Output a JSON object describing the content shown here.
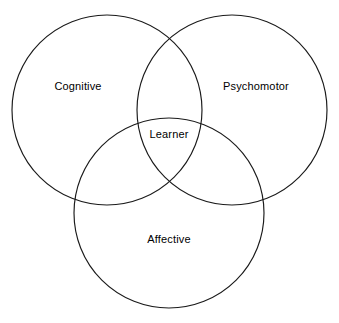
{
  "diagram": {
    "type": "venn-3-set",
    "title": "",
    "background_color": "#ffffff",
    "stroke_color": "#1a1a1a",
    "text_color": "#000000",
    "sets": [
      {
        "id": "cognitive",
        "label": "Cognitive",
        "position": "top-left",
        "cx": 107,
        "cy": 110,
        "r": 95,
        "label_x": 78,
        "label_y": 87
      },
      {
        "id": "psychomotor",
        "label": "Psychomotor",
        "position": "top-right",
        "cx": 232,
        "cy": 110,
        "r": 95,
        "label_x": 256,
        "label_y": 87
      },
      {
        "id": "affective",
        "label": "Affective",
        "position": "bottom-center",
        "cx": 169,
        "cy": 213,
        "r": 95,
        "label_x": 169,
        "label_y": 240
      }
    ],
    "intersection": {
      "id": "learner",
      "label": "Learner",
      "label_x": 169,
      "label_y": 135
    }
  }
}
